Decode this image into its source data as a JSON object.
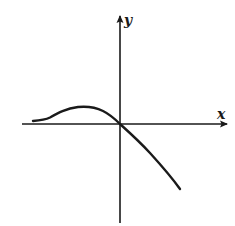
{
  "diagram": {
    "type": "function-graph",
    "axes": {
      "x_label": "x",
      "y_label": "y",
      "origin_px": [
        120,
        124
      ],
      "x_axis_px": {
        "from": [
          22,
          124
        ],
        "to": [
          228,
          124
        ]
      },
      "y_axis_px": {
        "from": [
          120,
          223
        ],
        "to": [
          120,
          15
        ]
      },
      "color": "#1a1a1a"
    },
    "curve": {
      "description": "Starts near x-axis on left, rises to a local maximum left of the y-axis, passes through the origin, then decreases steeply into quadrant IV",
      "points_px": [
        [
          33,
          121
        ],
        [
          45,
          119
        ],
        [
          55,
          114
        ],
        [
          68,
          109
        ],
        [
          85,
          107
        ],
        [
          98,
          109
        ],
        [
          108,
          114
        ],
        [
          120,
          124
        ],
        [
          135,
          138
        ],
        [
          150,
          153
        ],
        [
          165,
          170
        ],
        [
          180,
          189
        ]
      ],
      "color": "#1a1a1a"
    }
  }
}
